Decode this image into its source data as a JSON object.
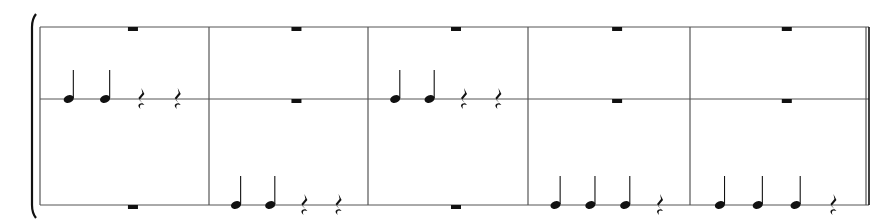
{
  "score": {
    "systems": 1,
    "staff_count": 3,
    "staff_y": [
      27,
      99,
      205
    ],
    "barlines_x": [
      40,
      209,
      368,
      528,
      690,
      866
    ],
    "colors": {
      "line": "#555555",
      "ink": "#111111"
    },
    "measures": [
      {
        "staves": [
          [
            "rest-whole"
          ],
          [
            "quarter",
            "quarter",
            "rest-quarter",
            "rest-quarter"
          ],
          [
            "rest-whole"
          ]
        ]
      },
      {
        "staves": [
          [
            "rest-whole"
          ],
          [
            "rest-whole"
          ],
          [
            "quarter",
            "quarter",
            "rest-quarter",
            "rest-quarter"
          ]
        ]
      },
      {
        "staves": [
          [
            "rest-whole"
          ],
          [
            "quarter",
            "quarter",
            "rest-quarter",
            "rest-quarter"
          ],
          [
            "rest-whole"
          ]
        ]
      },
      {
        "staves": [
          [
            "rest-whole"
          ],
          [
            "rest-whole"
          ],
          [
            "quarter",
            "quarter",
            "quarter",
            "rest-quarter"
          ]
        ]
      },
      {
        "staves": [
          [
            "rest-whole"
          ],
          [
            "rest-whole"
          ],
          [
            "quarter",
            "quarter",
            "quarter",
            "rest-quarter"
          ]
        ]
      }
    ]
  }
}
